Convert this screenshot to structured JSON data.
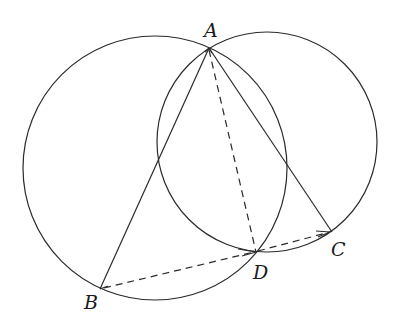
{
  "figure": {
    "type": "geometry",
    "colors": {
      "stroke": "#2a2a2a",
      "label": "#1a1a1a",
      "background": "#ffffff"
    },
    "circles": [
      {
        "name": "left-circle",
        "cx": 155,
        "cy": 168,
        "r": 132
      },
      {
        "name": "right-circle",
        "cx": 267,
        "cy": 142,
        "r": 110
      }
    ],
    "points": {
      "A": {
        "x": 209,
        "y": 48
      },
      "B": {
        "x": 100,
        "y": 289
      },
      "C": {
        "x": 332,
        "y": 232
      },
      "D": {
        "x": 256,
        "y": 252
      }
    },
    "segments": [
      {
        "from": "A",
        "to": "B",
        "style": "solid"
      },
      {
        "from": "A",
        "to": "C",
        "style": "solid"
      },
      {
        "from": "A",
        "to": "D",
        "style": "dashed"
      },
      {
        "from": "B",
        "to": "D",
        "style": "dashed",
        "arrow_at": "D"
      },
      {
        "from": "D",
        "to": "C",
        "style": "dashed",
        "arrow_at": "C"
      }
    ],
    "labels": {
      "A": "A",
      "B": "B",
      "C": "C",
      "D": "D"
    }
  }
}
